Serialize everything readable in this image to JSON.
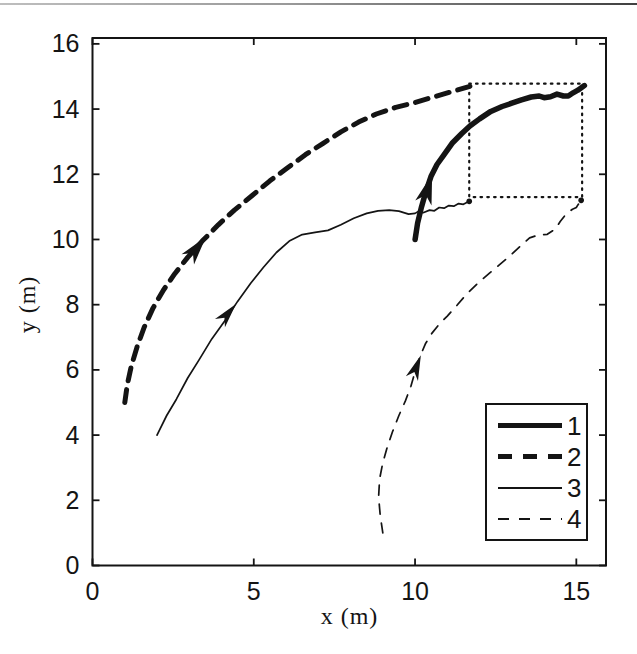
{
  "figure": {
    "background": "#ffffff",
    "ink_color": "#141414",
    "scan_artifact_line": "top-edge"
  },
  "chart_data": {
    "type": "line",
    "title": "",
    "xlabel": "x (m)",
    "ylabel": "y (m)",
    "xlim": [
      0,
      15.92
    ],
    "ylim": [
      0,
      16.18
    ],
    "xticks": [
      0,
      5,
      10,
      15
    ],
    "yticks": [
      0,
      2,
      4,
      6,
      8,
      10,
      12,
      14,
      16
    ],
    "grid": false,
    "legend_position": "southeast",
    "legend_entries": [
      "1",
      "2",
      "3",
      "4"
    ],
    "series": [
      {
        "name": "1",
        "line": "solid",
        "width": 5.5,
        "points": [
          [
            10.0,
            10.0
          ],
          [
            10.08,
            10.5
          ],
          [
            10.2,
            11.0
          ],
          [
            10.33,
            11.45
          ],
          [
            10.5,
            11.95
          ],
          [
            10.68,
            12.3
          ],
          [
            10.9,
            12.6
          ],
          [
            11.15,
            12.95
          ],
          [
            11.45,
            13.25
          ],
          [
            11.7,
            13.48
          ],
          [
            12.0,
            13.7
          ],
          [
            12.35,
            13.93
          ],
          [
            12.7,
            14.08
          ],
          [
            13.0,
            14.18
          ],
          [
            13.3,
            14.28
          ],
          [
            13.6,
            14.37
          ],
          [
            13.85,
            14.4
          ],
          [
            14.0,
            14.35
          ],
          [
            14.2,
            14.38
          ],
          [
            14.4,
            14.46
          ],
          [
            14.6,
            14.4
          ],
          [
            14.75,
            14.4
          ],
          [
            14.9,
            14.5
          ],
          [
            15.05,
            14.58
          ],
          [
            15.25,
            14.72
          ]
        ]
      },
      {
        "name": "2",
        "line": "dashed",
        "width": 5,
        "dash": [
          13,
          9
        ],
        "points": [
          [
            1.0,
            5.0
          ],
          [
            1.08,
            5.55
          ],
          [
            1.2,
            6.1
          ],
          [
            1.38,
            6.7
          ],
          [
            1.6,
            7.3
          ],
          [
            1.88,
            7.9
          ],
          [
            2.2,
            8.45
          ],
          [
            2.55,
            8.95
          ],
          [
            2.95,
            9.45
          ],
          [
            3.4,
            9.95
          ],
          [
            3.9,
            10.45
          ],
          [
            4.4,
            10.9
          ],
          [
            4.95,
            11.35
          ],
          [
            5.5,
            11.8
          ],
          [
            6.05,
            12.2
          ],
          [
            6.6,
            12.6
          ],
          [
            7.15,
            12.95
          ],
          [
            7.7,
            13.3
          ],
          [
            8.25,
            13.6
          ],
          [
            8.8,
            13.85
          ],
          [
            9.4,
            14.05
          ],
          [
            10.0,
            14.2
          ],
          [
            10.6,
            14.38
          ],
          [
            11.2,
            14.55
          ],
          [
            11.7,
            14.7
          ]
        ]
      },
      {
        "name": "3",
        "line": "solid",
        "width": 1.7,
        "points": [
          [
            2.0,
            4.0
          ],
          [
            2.3,
            4.6
          ],
          [
            2.6,
            5.1
          ],
          [
            2.95,
            5.75
          ],
          [
            3.3,
            6.3
          ],
          [
            3.7,
            6.95
          ],
          [
            4.1,
            7.5
          ],
          [
            4.5,
            8.1
          ],
          [
            4.9,
            8.65
          ],
          [
            5.3,
            9.15
          ],
          [
            5.7,
            9.6
          ],
          [
            6.1,
            9.95
          ],
          [
            6.5,
            10.15
          ],
          [
            6.9,
            10.22
          ],
          [
            7.3,
            10.28
          ],
          [
            7.7,
            10.45
          ],
          [
            8.1,
            10.65
          ],
          [
            8.5,
            10.8
          ],
          [
            8.85,
            10.88
          ],
          [
            9.2,
            10.9
          ],
          [
            9.5,
            10.87
          ],
          [
            9.8,
            10.78
          ],
          [
            10.0,
            10.8
          ],
          [
            10.1,
            10.86
          ],
          [
            10.25,
            10.82
          ],
          [
            10.45,
            10.9
          ],
          [
            10.6,
            10.88
          ],
          [
            10.75,
            10.98
          ],
          [
            10.9,
            10.96
          ],
          [
            11.05,
            11.04
          ],
          [
            11.2,
            11.02
          ],
          [
            11.35,
            11.1
          ],
          [
            11.5,
            11.08
          ],
          [
            11.68,
            11.17
          ]
        ]
      },
      {
        "name": "4",
        "line": "dashed",
        "width": 1.7,
        "dash": [
          10,
          9
        ],
        "points": [
          [
            9.0,
            1.0
          ],
          [
            8.92,
            1.55
          ],
          [
            8.87,
            2.1
          ],
          [
            8.9,
            2.65
          ],
          [
            9.0,
            3.15
          ],
          [
            9.13,
            3.6
          ],
          [
            9.3,
            4.1
          ],
          [
            9.5,
            4.6
          ],
          [
            9.7,
            5.05
          ],
          [
            9.87,
            5.5
          ],
          [
            10.0,
            5.95
          ],
          [
            10.15,
            6.4
          ],
          [
            10.32,
            6.8
          ],
          [
            10.52,
            7.12
          ],
          [
            10.75,
            7.4
          ],
          [
            11.0,
            7.65
          ],
          [
            11.3,
            7.98
          ],
          [
            11.62,
            8.35
          ],
          [
            11.95,
            8.66
          ],
          [
            12.3,
            8.96
          ],
          [
            12.65,
            9.25
          ],
          [
            13.0,
            9.55
          ],
          [
            13.3,
            9.83
          ],
          [
            13.55,
            10.05
          ],
          [
            13.8,
            10.13
          ],
          [
            14.1,
            10.16
          ],
          [
            14.35,
            10.32
          ],
          [
            14.5,
            10.55
          ],
          [
            14.68,
            10.78
          ],
          [
            14.88,
            10.93
          ],
          [
            15.0,
            10.98
          ],
          [
            15.05,
            11.06
          ],
          [
            15.15,
            11.2
          ]
        ]
      }
    ],
    "direction_arrows": [
      {
        "series": "1",
        "x": 10.53,
        "y": 12.0,
        "angle_deg": 73,
        "length": 30,
        "half_width": 8.5
      },
      {
        "series": "2",
        "x": 3.52,
        "y": 10.08,
        "angle_deg": 51,
        "length": 29,
        "half_width": 8
      },
      {
        "series": "3",
        "x": 4.45,
        "y": 8.02,
        "angle_deg": 50,
        "length": 25,
        "half_width": 6.5
      },
      {
        "series": "4",
        "x": 10.18,
        "y": 6.45,
        "angle_deg": 69,
        "length": 25,
        "half_width": 6.5
      }
    ],
    "zoom_box": {
      "x": [
        11.68,
        15.18
      ],
      "y": [
        11.3,
        14.78
      ],
      "style": "dotted"
    }
  }
}
